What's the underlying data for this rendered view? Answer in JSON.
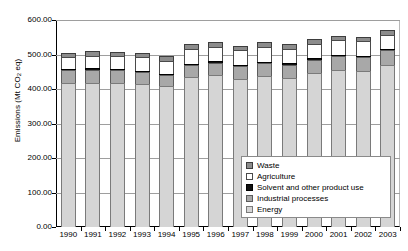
{
  "chart_data": {
    "type": "bar",
    "stacked": true,
    "title": "",
    "xlabel": "",
    "ylabel": "Emissions (Mt CO",
    "ylabel_sub": "2",
    "ylabel_tail": " eq)",
    "ylabel_full": "Emissions (Mt CO2 eq)",
    "ylim": [
      0,
      600
    ],
    "ytick_step": 100,
    "ytick_labels": [
      "600.00",
      "500.00",
      "400.00",
      "300.00",
      "200.00",
      "100.00",
      "0.00"
    ],
    "ytick_values": [
      600,
      500,
      400,
      300,
      200,
      100,
      0
    ],
    "grid": true,
    "legend_position": "inside-bottom-right",
    "categories": [
      "1990",
      "1991",
      "1992",
      "1993",
      "1994",
      "1995",
      "1996",
      "1997",
      "1998",
      "1999",
      "2000",
      "2001",
      "2002",
      "2003"
    ],
    "series": [
      {
        "name": "Energy",
        "color": "#d5d5d5",
        "values": [
          417,
          418,
          417,
          415,
          410,
          435,
          440,
          430,
          437,
          432,
          446,
          455,
          452,
          470
        ]
      },
      {
        "name": "Industrial processes",
        "color": "#a8a8a8",
        "values": [
          38,
          38,
          37,
          33,
          30,
          35,
          36,
          37,
          38,
          38,
          39,
          40,
          40,
          42
        ]
      },
      {
        "name": "Solvent and other product use",
        "color": "#111111",
        "values": [
          4,
          4,
          4,
          4,
          4,
          4,
          4,
          4,
          4,
          4,
          4,
          4,
          4,
          4
        ]
      },
      {
        "name": "Agriculture",
        "color": "#ffffff",
        "values": [
          33,
          36,
          37,
          40,
          38,
          43,
          43,
          42,
          43,
          43,
          43,
          43,
          43,
          40
        ]
      },
      {
        "name": "Waste",
        "color": "#8c8c8c",
        "values": [
          13,
          14,
          13,
          13,
          13,
          13,
          12,
          12,
          13,
          13,
          13,
          13,
          13,
          14
        ]
      }
    ],
    "totals": [
      505,
      510,
      508,
      505,
      495,
      530,
      535,
      525,
      535,
      530,
      545,
      555,
      552,
      570
    ]
  },
  "legend": {
    "items": [
      {
        "label": "Waste",
        "swatch": "waste-swatch"
      },
      {
        "label": "Agriculture",
        "swatch": "agriculture-swatch"
      },
      {
        "label": "Solvent and other product use",
        "swatch": "solvent-swatch"
      },
      {
        "label": "Industrial processes",
        "swatch": "industrial-swatch"
      },
      {
        "label": "Energy",
        "swatch": "energy-swatch"
      }
    ]
  }
}
